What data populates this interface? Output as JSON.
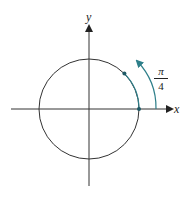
{
  "diagram": {
    "axes": {
      "x_label": "x",
      "y_label": "y"
    },
    "angle": {
      "numerator": "π",
      "denominator": "4"
    },
    "colors": {
      "axis": "#333333",
      "circle": "#333333",
      "arc": "#2e7f8a"
    }
  }
}
